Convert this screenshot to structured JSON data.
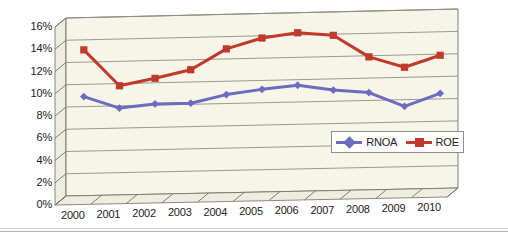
{
  "chart_data": {
    "type": "line",
    "title": "",
    "subtitle": "",
    "xlabel": "",
    "ylabel": "",
    "categories": [
      "2000",
      "2001",
      "2002",
      "2003",
      "2004",
      "2005",
      "2006",
      "2007",
      "2008",
      "2009",
      "2010"
    ],
    "series": [
      {
        "name": "RNOA",
        "color": "#6b6cc0",
        "marker": "diamond",
        "values": [
          8.9,
          7.8,
          8.1,
          8.1,
          8.8,
          9.2,
          9.5,
          9.0,
          8.7,
          7.4,
          8.5
        ]
      },
      {
        "name": "ROE",
        "color": "#c0392b",
        "marker": "square",
        "values": [
          13.1,
          9.8,
          10.4,
          11.1,
          12.9,
          13.8,
          14.2,
          13.9,
          11.9,
          10.9,
          11.9
        ]
      }
    ],
    "ylim": [
      0,
      16
    ],
    "ytick_values": [
      0,
      2,
      4,
      6,
      8,
      10,
      12,
      14,
      16
    ],
    "ytick_labels": [
      "0%",
      "2%",
      "4%",
      "6%",
      "8%",
      "10%",
      "12%",
      "14%",
      "16%"
    ],
    "xtick_labels": [
      "2000",
      "2001",
      "2002",
      "2003",
      "2004",
      "2005",
      "2006",
      "2007",
      "2008",
      "2009",
      "2010"
    ],
    "grid": "horizontal",
    "legend_position": "inside-bottom-right",
    "plot_background": "#f7f5e8",
    "grid_color": "#8e8e83",
    "axis_color": "#6f6f63",
    "style": "3d-perspective"
  },
  "legend": {
    "entries": [
      {
        "label": "RNOA",
        "color": "#6b6cc0",
        "marker": "diamond"
      },
      {
        "label": "ROE",
        "color": "#c0392b",
        "marker": "square"
      }
    ]
  },
  "decor": {
    "rule_color": "#b9a8c4",
    "rule_color_light": "#d8ccdd"
  }
}
